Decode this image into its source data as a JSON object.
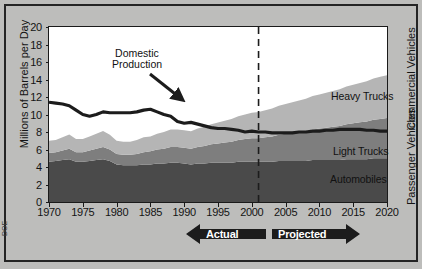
{
  "figure": {
    "source_note": "DOE"
  },
  "axes": {
    "ylabel": "Millions of Barrels per Day",
    "yticks": [
      20,
      18,
      16,
      14,
      12,
      10,
      8,
      6,
      4,
      2,
      0
    ],
    "xticks": [
      1970,
      1975,
      1980,
      1985,
      1990,
      1995,
      2000,
      2005,
      2010,
      2015,
      2020
    ],
    "right_label_top": "Commercial Vehicles",
    "right_label_bottom": "Passenger Vehicles"
  },
  "annotations": {
    "domestic_production_line1": "Domestic",
    "domestic_production_line2": "Production",
    "actual": "Actual",
    "projected": "Projected",
    "divider_year": 2001
  },
  "series_labels": {
    "heavy_trucks": "Heavy Trucks",
    "light_trucks": "Light Trucks",
    "automobiles": "Automobiles"
  },
  "colors": {
    "automobiles": "#4a4a4a",
    "light_trucks": "#7e7e7e",
    "heavy_trucks": "#b5b5b5",
    "domestic_line": "#1c1c1c",
    "background": "#bdbdbb",
    "plot_background": "#ffffff",
    "frame": "#242424"
  },
  "chart_data": {
    "type": "area",
    "title": "",
    "xlabel": "",
    "ylabel": "Millions of Barrels per Day",
    "xlim": [
      1970,
      2020
    ],
    "ylim": [
      0,
      20
    ],
    "grid": false,
    "legend": "inline-labels",
    "stacked": true,
    "x": [
      1970,
      1971,
      1972,
      1973,
      1974,
      1975,
      1976,
      1977,
      1978,
      1979,
      1980,
      1981,
      1982,
      1983,
      1984,
      1985,
      1986,
      1987,
      1988,
      1989,
      1990,
      1991,
      1992,
      1993,
      1994,
      1995,
      1996,
      1997,
      1998,
      1999,
      2000,
      2001,
      2002,
      2003,
      2004,
      2005,
      2006,
      2007,
      2008,
      2009,
      2010,
      2011,
      2012,
      2013,
      2014,
      2015,
      2016,
      2017,
      2018,
      2019,
      2020
    ],
    "series": [
      {
        "name": "Automobiles",
        "values": [
          4.6,
          4.7,
          4.8,
          4.9,
          4.6,
          4.6,
          4.7,
          4.8,
          4.9,
          4.7,
          4.3,
          4.2,
          4.2,
          4.2,
          4.3,
          4.3,
          4.4,
          4.4,
          4.5,
          4.5,
          4.4,
          4.3,
          4.4,
          4.4,
          4.5,
          4.5,
          4.5,
          4.5,
          4.6,
          4.6,
          4.6,
          4.6,
          4.6,
          4.6,
          4.7,
          4.7,
          4.7,
          4.7,
          4.7,
          4.8,
          4.8,
          4.8,
          4.8,
          4.8,
          4.9,
          4.9,
          4.9,
          4.9,
          5.0,
          5.0,
          5.0
        ]
      },
      {
        "name": "Light Trucks",
        "values": [
          1.0,
          1.0,
          1.1,
          1.2,
          1.1,
          1.1,
          1.2,
          1.3,
          1.4,
          1.3,
          1.2,
          1.2,
          1.2,
          1.3,
          1.4,
          1.5,
          1.6,
          1.7,
          1.8,
          1.8,
          1.8,
          1.8,
          1.9,
          2.0,
          2.1,
          2.2,
          2.3,
          2.4,
          2.5,
          2.6,
          2.7,
          2.7,
          2.8,
          2.9,
          3.0,
          3.1,
          3.2,
          3.3,
          3.4,
          3.5,
          3.6,
          3.7,
          3.8,
          3.9,
          4.0,
          4.1,
          4.2,
          4.3,
          4.4,
          4.5,
          4.6
        ]
      },
      {
        "name": "Heavy Trucks",
        "values": [
          1.4,
          1.4,
          1.5,
          1.6,
          1.5,
          1.5,
          1.6,
          1.7,
          1.8,
          1.7,
          1.5,
          1.5,
          1.5,
          1.6,
          1.7,
          1.7,
          1.8,
          1.9,
          2.0,
          2.0,
          2.0,
          2.0,
          2.1,
          2.2,
          2.3,
          2.4,
          2.5,
          2.6,
          2.7,
          2.8,
          2.9,
          3.0,
          3.1,
          3.2,
          3.3,
          3.4,
          3.5,
          3.6,
          3.7,
          3.8,
          3.9,
          4.0,
          4.1,
          4.2,
          4.3,
          4.4,
          4.5,
          4.6,
          4.7,
          4.8,
          4.9
        ]
      }
    ],
    "line_series": {
      "name": "Domestic Production",
      "values": [
        11.4,
        11.3,
        11.2,
        11.0,
        10.5,
        10.0,
        9.8,
        10.0,
        10.3,
        10.2,
        10.2,
        10.2,
        10.2,
        10.3,
        10.5,
        10.6,
        10.3,
        10.0,
        9.8,
        9.2,
        9.0,
        9.1,
        8.9,
        8.7,
        8.5,
        8.4,
        8.4,
        8.3,
        8.2,
        8.0,
        8.1,
        8.0,
        8.0,
        7.9,
        7.9,
        7.9,
        7.9,
        8.0,
        8.0,
        8.1,
        8.1,
        8.2,
        8.2,
        8.3,
        8.3,
        8.3,
        8.3,
        8.2,
        8.2,
        8.1,
        8.1
      ]
    }
  }
}
